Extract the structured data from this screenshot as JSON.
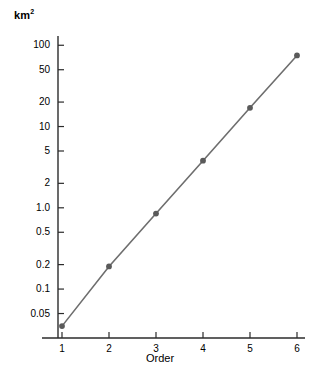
{
  "chart_data": {
    "type": "line",
    "title": "",
    "xlabel": "Order",
    "ylabel": "km2",
    "ylabel_display": "km",
    "ylabel_exponent": "2",
    "x": [
      1,
      2,
      3,
      4,
      5,
      6
    ],
    "values": [
      0.035,
      0.19,
      0.85,
      3.8,
      17,
      75
    ],
    "series": [
      {
        "name": "area",
        "values": [
          0.035,
          0.19,
          0.85,
          3.8,
          17,
          75
        ]
      }
    ],
    "yscale": "log",
    "xscale": "linear",
    "xlim": [
      0.6,
      6.4
    ],
    "ylim": [
      0.025,
      130
    ],
    "grid": false,
    "legend": "none",
    "markers": "circle",
    "line_color": "#6e6e6e",
    "marker_color": "#5a5a5a",
    "axis_color": "#2b2b2b",
    "xticks": [
      "1",
      "2",
      "3",
      "4",
      "5",
      "6"
    ],
    "xtick_values": [
      1,
      2,
      3,
      4,
      5,
      6
    ],
    "yticks": [
      "100",
      "50",
      "20",
      "10",
      "5",
      "2",
      "1.0",
      "0.5",
      "0.2",
      "0.1",
      "0.05"
    ],
    "ytick_values": [
      100,
      50,
      20,
      10,
      5,
      2,
      1.0,
      0.5,
      0.2,
      0.1,
      0.05
    ]
  },
  "layout": {
    "plot_left": 58,
    "plot_right": 305,
    "plot_top": 36,
    "plot_bottom": 338,
    "tick_len": 6,
    "x_first": 62,
    "x_step": 47
  }
}
